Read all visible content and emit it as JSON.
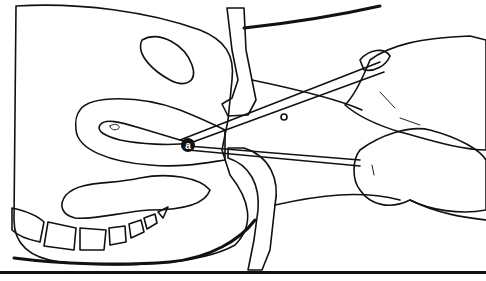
{
  "figure": {
    "type": "medical line illustration",
    "labels": [
      {
        "id": "a",
        "text": "a",
        "x": 188,
        "y": 145
      }
    ],
    "colors": {
      "ink": "#111111",
      "background": "#ffffff",
      "stipple": "#bdbdbd",
      "dense_stipple": "#7a7a7a"
    },
    "bottom_rule": {
      "y": 272,
      "color": "#111111"
    }
  }
}
